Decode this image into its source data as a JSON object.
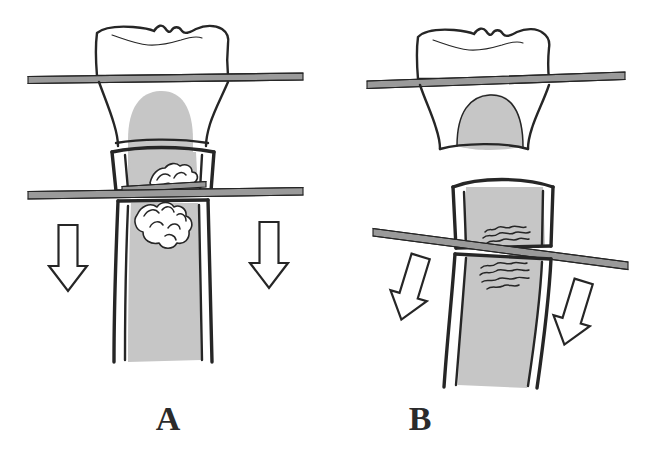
{
  "figure": {
    "background_color": "#ffffff",
    "ink_color": "#262626",
    "pulp_color": "#c6c6c6",
    "wire_color": "#9a9a9a",
    "width": 656,
    "height": 463,
    "style": "hand-drawn line illustration"
  },
  "panels": [
    {
      "id": "A",
      "label": "A",
      "label_x": 168,
      "label_y": 430,
      "description": "Tooth crown above horizontal elevator; fractured root segment with debris; second horizontal elevator at fracture line; two vertical downward arrows",
      "parts": {
        "crown": "occlusal-crown",
        "pulp": "pulp-chamber",
        "root": "root-canal",
        "fracture_debris": "bone-fragment-cluster",
        "upper_instrument": "elevator-wire-upper",
        "lower_instrument": "elevator-wire-lower"
      },
      "arrows": [
        {
          "name": "force-arrow-left",
          "x": 68,
          "y": 258,
          "rotation": 0,
          "direction": "down"
        },
        {
          "name": "force-arrow-right",
          "x": 269,
          "y": 255,
          "rotation": 0,
          "direction": "down"
        }
      ]
    },
    {
      "id": "B",
      "label": "B",
      "label_x": 420,
      "label_y": 430,
      "description": "Tooth crown above horizontal elevator; separated root fragment below with wavy fracture margin; tilted elevator wire; two oblique downward arrows",
      "parts": {
        "crown": "occlusal-crown",
        "pulp": "pulp-chamber",
        "root": "root-canal",
        "fracture_debris": "wavy-fracture-margin",
        "upper_instrument": "elevator-wire-upper",
        "lower_instrument": "elevator-wire-tilted"
      },
      "arrows": [
        {
          "name": "force-arrow-left",
          "x": 411,
          "y": 288,
          "rotation": 17,
          "direction": "down-right"
        },
        {
          "name": "force-arrow-right",
          "x": 574,
          "y": 313,
          "rotation": 17,
          "direction": "down-right"
        }
      ]
    }
  ]
}
